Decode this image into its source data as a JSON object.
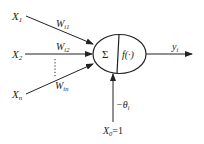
{
  "diagram": {
    "inputs": [
      {
        "label": "X",
        "sub": "1",
        "weight": "W",
        "weight_sub": "i1"
      },
      {
        "label": "X",
        "sub": "2",
        "weight": "W",
        "weight_sub": "i2"
      },
      {
        "label": "X",
        "sub": "n",
        "weight": "W",
        "weight_sub": "in"
      }
    ],
    "summation_symbol": "Σ",
    "activation": "f(·)",
    "output": {
      "label": "y",
      "sub": "i"
    },
    "bias": {
      "label": "−θ",
      "sub": "i"
    },
    "bias_input": {
      "label": "X",
      "sub": "0",
      "value": "=1"
    },
    "colors": {
      "stroke": "#222222",
      "background": "#ffffff"
    }
  }
}
